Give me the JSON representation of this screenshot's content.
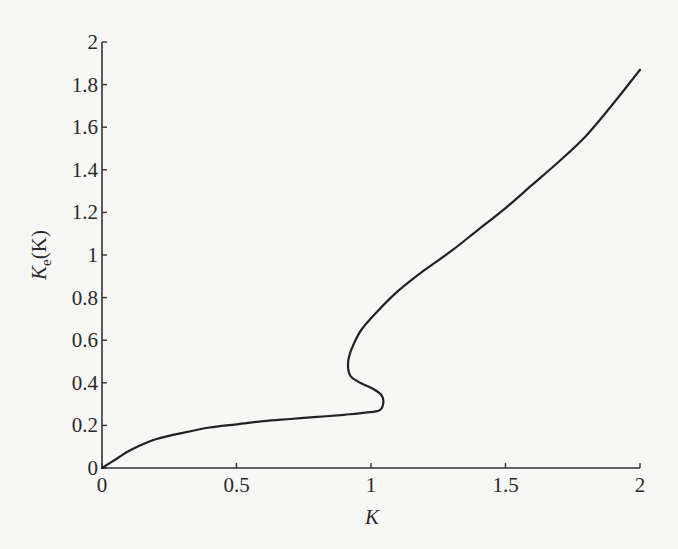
{
  "chart_data": {
    "type": "line",
    "title": "",
    "xlabel": "K",
    "ylabel": "K_e(K)",
    "ylabel_parts": {
      "main": "K",
      "sub": "e",
      "arg": "(K)"
    },
    "xlim": [
      0,
      2
    ],
    "ylim": [
      0,
      2
    ],
    "grid": false,
    "legend": null,
    "x_ticks": [
      0,
      0.5,
      1,
      1.5,
      2
    ],
    "x_tick_labels": [
      "0",
      "0.5",
      "1",
      "1.5",
      "2"
    ],
    "y_ticks": [
      0,
      0.2,
      0.4,
      0.6,
      0.8,
      1,
      1.2,
      1.4,
      1.6,
      1.8,
      2
    ],
    "y_tick_labels": [
      "0",
      "0.2",
      "0.4",
      "0.6",
      "0.8",
      "1",
      "1.2",
      "1.4",
      "1.6",
      "1.8",
      "2"
    ],
    "series": [
      {
        "name": "K_e(K)",
        "color": "#222222",
        "points": [
          [
            0.0,
            0.0
          ],
          [
            0.05,
            0.04
          ],
          [
            0.1,
            0.08
          ],
          [
            0.15,
            0.11
          ],
          [
            0.2,
            0.135
          ],
          [
            0.3,
            0.165
          ],
          [
            0.4,
            0.19
          ],
          [
            0.5,
            0.205
          ],
          [
            0.6,
            0.22
          ],
          [
            0.7,
            0.23
          ],
          [
            0.8,
            0.24
          ],
          [
            0.9,
            0.25
          ],
          [
            0.98,
            0.26
          ],
          [
            1.03,
            0.27
          ],
          [
            1.045,
            0.3
          ],
          [
            1.04,
            0.34
          ],
          [
            1.01,
            0.37
          ],
          [
            0.96,
            0.4
          ],
          [
            0.925,
            0.43
          ],
          [
            0.915,
            0.47
          ],
          [
            0.918,
            0.52
          ],
          [
            0.935,
            0.58
          ],
          [
            0.965,
            0.65
          ],
          [
            1.02,
            0.73
          ],
          [
            1.1,
            0.83
          ],
          [
            1.2,
            0.93
          ],
          [
            1.3,
            1.02
          ],
          [
            1.4,
            1.12
          ],
          [
            1.5,
            1.22
          ],
          [
            1.6,
            1.33
          ],
          [
            1.7,
            1.44
          ],
          [
            1.8,
            1.56
          ],
          [
            1.9,
            1.71
          ],
          [
            2.0,
            1.87
          ]
        ]
      }
    ]
  }
}
